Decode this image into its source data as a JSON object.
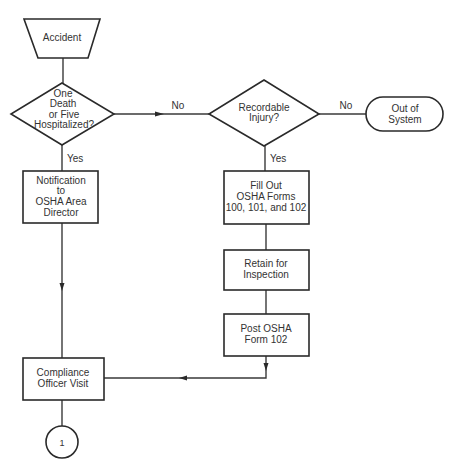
{
  "diagram": {
    "type": "flowchart",
    "colors": {
      "stroke": "#2a2a2a",
      "background": "#ffffff",
      "text": "#333333"
    },
    "nodes": {
      "accident": {
        "shape": "trapezoid",
        "lines": [
          "Accident"
        ]
      },
      "death_check": {
        "shape": "diamond",
        "lines": [
          "One",
          "Death",
          "or Five",
          "Hospitalized?"
        ]
      },
      "recordable": {
        "shape": "diamond",
        "lines": [
          "Recordable",
          "Injury?"
        ]
      },
      "out_of_system": {
        "shape": "terminator",
        "lines": [
          "Out of",
          "System"
        ]
      },
      "notification": {
        "shape": "rectangle",
        "lines": [
          "Notification",
          "to",
          "OSHA Area",
          "Director"
        ]
      },
      "fill_out": {
        "shape": "rectangle",
        "lines": [
          "Fill Out",
          "OSHA Forms",
          "100, 101, and 102"
        ]
      },
      "retain": {
        "shape": "rectangle",
        "lines": [
          "Retain for",
          "Inspection"
        ]
      },
      "post": {
        "shape": "rectangle",
        "lines": [
          "Post OSHA",
          "Form 102"
        ]
      },
      "compliance": {
        "shape": "rectangle",
        "lines": [
          "Compliance",
          "Officer Visit"
        ]
      },
      "connector": {
        "shape": "circle",
        "lines": [
          "1"
        ]
      }
    },
    "edges": [
      {
        "from": "accident",
        "to": "death_check",
        "label": ""
      },
      {
        "from": "death_check",
        "to": "recordable",
        "label": "No"
      },
      {
        "from": "death_check",
        "to": "notification",
        "label": "Yes"
      },
      {
        "from": "recordable",
        "to": "out_of_system",
        "label": "No"
      },
      {
        "from": "recordable",
        "to": "fill_out",
        "label": "Yes"
      },
      {
        "from": "fill_out",
        "to": "retain",
        "label": ""
      },
      {
        "from": "retain",
        "to": "post",
        "label": ""
      },
      {
        "from": "post",
        "to": "compliance",
        "label": ""
      },
      {
        "from": "notification",
        "to": "compliance",
        "label": ""
      },
      {
        "from": "compliance",
        "to": "connector",
        "label": ""
      }
    ],
    "labels": {
      "no": "No",
      "yes": "Yes"
    }
  }
}
